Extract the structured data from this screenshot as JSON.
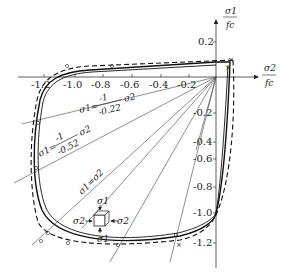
{
  "figure": {
    "x_axis": {
      "label_num": "σ2",
      "label_den": "fc",
      "ticks": [
        "-1.2",
        "-1.0",
        "-0.8",
        "-0.6",
        "-0.4",
        "-0.2"
      ]
    },
    "y_axis": {
      "label_num": "σ1",
      "label_den": "fc",
      "ticks": [
        "0.2",
        "-0.2",
        "-0.4",
        "-0.6",
        "-0.8",
        "-1.0",
        "-1.2"
      ]
    },
    "ray_labels": {
      "ray_022": {
        "prefix": "σ1=",
        "num": "-1",
        "den": "-0.22",
        "suffix": "σ2"
      },
      "ray_052": {
        "prefix": "σ1=",
        "num": "-1",
        "den": "-0.52",
        "suffix": "σ2"
      },
      "ray_equal": "σ1=σ2"
    },
    "inset": {
      "top": "σ1",
      "bottom": "σ1",
      "left": "σ2",
      "right": "σ2"
    }
  }
}
